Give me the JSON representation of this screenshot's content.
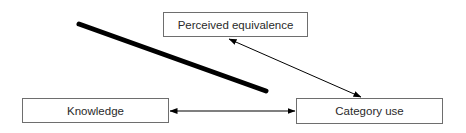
{
  "diagram": {
    "nodes": [
      {
        "id": "perceived-equivalence",
        "label": "Perceived equivalence"
      },
      {
        "id": "knowledge",
        "label": "Knowledge"
      },
      {
        "id": "category-use",
        "label": "Category use"
      }
    ],
    "edges": [
      {
        "from": "knowledge",
        "to": "category-use",
        "type": "bidirectional-arrow"
      },
      {
        "from": "perceived-equivalence",
        "to": "category-use",
        "type": "bidirectional-arrow"
      }
    ],
    "annotations": [
      {
        "type": "thick-diagonal-line",
        "description": "heavy black stroke crossing diagram"
      }
    ],
    "colors": {
      "stroke": "#000000",
      "box_border": "#6e6e6e",
      "text": "#2a2a2a",
      "background": "#ffffff"
    }
  }
}
